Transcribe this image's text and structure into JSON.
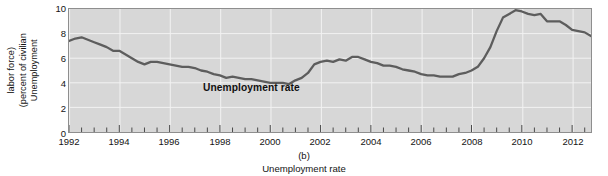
{
  "chart_data": {
    "type": "line",
    "title": "",
    "panel_label": "(b)",
    "subtitle": "Unemployment rate",
    "series_annotation": "Unemployment rate",
    "xlabel": "",
    "ylabel": "Unemployment (percent of civilian labor force)",
    "ylabel_lines": [
      "Unemployment",
      "(percent of civilian",
      "labor force)"
    ],
    "ylim": [
      0,
      10
    ],
    "yticks": [
      0,
      2,
      4,
      6,
      8,
      10
    ],
    "ytick_labels": [
      "0",
      "2",
      "4",
      "6",
      "8",
      "10"
    ],
    "xlim": [
      1992,
      2012.75
    ],
    "xticks": [
      1992,
      1994,
      1996,
      1998,
      2000,
      2002,
      2004,
      2006,
      2008,
      2010,
      2012
    ],
    "xtick_labels": [
      "1992",
      "1994",
      "1996",
      "1998",
      "2000",
      "2002",
      "2004",
      "2006",
      "2008",
      "2010",
      "2012"
    ],
    "minor_xtick_interval": 0.5,
    "grid": "white gridlines at yticks 2,4,6,8 and xticks every 2 years",
    "legend": "none (inline annotation)",
    "line_color": "#5d5d5d",
    "plot_background": "#d7d7d7",
    "series": [
      {
        "name": "Unemployment rate",
        "x": [
          1992.0,
          1992.25,
          1992.5,
          1992.75,
          1993.0,
          1993.25,
          1993.5,
          1993.75,
          1994.0,
          1994.25,
          1994.5,
          1994.75,
          1995.0,
          1995.25,
          1995.5,
          1995.75,
          1996.0,
          1996.25,
          1996.5,
          1996.75,
          1997.0,
          1997.25,
          1997.5,
          1997.75,
          1998.0,
          1998.25,
          1998.5,
          1998.75,
          1999.0,
          1999.25,
          1999.5,
          1999.75,
          2000.0,
          2000.25,
          2000.5,
          2000.75,
          2001.0,
          2001.25,
          2001.5,
          2001.75,
          2002.0,
          2002.25,
          2002.5,
          2002.75,
          2003.0,
          2003.25,
          2003.5,
          2003.75,
          2004.0,
          2004.25,
          2004.5,
          2004.75,
          2005.0,
          2005.25,
          2005.5,
          2005.75,
          2006.0,
          2006.25,
          2006.5,
          2006.75,
          2007.0,
          2007.25,
          2007.5,
          2007.75,
          2008.0,
          2008.25,
          2008.5,
          2008.75,
          2009.0,
          2009.25,
          2009.5,
          2009.75,
          2010.0,
          2010.25,
          2010.5,
          2010.75,
          2011.0,
          2011.25,
          2011.5,
          2011.75,
          2012.0,
          2012.25,
          2012.5,
          2012.75
        ],
        "y": [
          7.4,
          7.6,
          7.7,
          7.5,
          7.3,
          7.1,
          6.9,
          6.6,
          6.6,
          6.3,
          6.0,
          5.7,
          5.5,
          5.7,
          5.7,
          5.6,
          5.5,
          5.4,
          5.3,
          5.3,
          5.2,
          5.0,
          4.9,
          4.7,
          4.6,
          4.4,
          4.5,
          4.4,
          4.3,
          4.3,
          4.2,
          4.1,
          4.0,
          4.0,
          4.0,
          3.9,
          4.2,
          4.4,
          4.8,
          5.5,
          5.7,
          5.8,
          5.7,
          5.9,
          5.8,
          6.1,
          6.1,
          5.9,
          5.7,
          5.6,
          5.4,
          5.4,
          5.3,
          5.1,
          5.0,
          4.9,
          4.7,
          4.6,
          4.6,
          4.5,
          4.5,
          4.5,
          4.7,
          4.8,
          5.0,
          5.3,
          6.0,
          6.9,
          8.2,
          9.3,
          9.6,
          9.9,
          9.8,
          9.6,
          9.5,
          9.6,
          9.0,
          9.0,
          9.0,
          8.7,
          8.3,
          8.2,
          8.1,
          7.8
        ],
        "endpoints": {
          "start": 7.4,
          "start_peak": 7.7,
          "trough_2000": 3.9,
          "local_peak_2003": 6.1,
          "trough_2006": 4.5,
          "peak_2009": 9.9,
          "end": 7.8
        }
      }
    ]
  }
}
